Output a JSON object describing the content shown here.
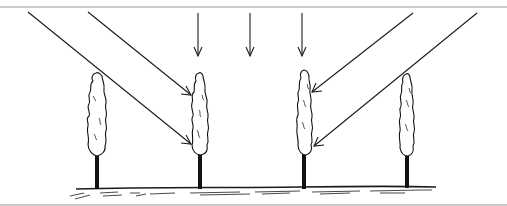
{
  "diagram": {
    "colors": {
      "background": "#ffffff",
      "ink": "#1a1a1a",
      "frame": "#b8b8b8"
    },
    "trees": [
      {
        "id": "tree-1",
        "x": 97
      },
      {
        "id": "tree-2",
        "x": 200
      },
      {
        "id": "tree-3",
        "x": 304
      },
      {
        "id": "tree-4",
        "x": 407
      }
    ],
    "arrows": {
      "left_diagonal": 2,
      "vertical": 3,
      "right_diagonal": 2
    }
  }
}
